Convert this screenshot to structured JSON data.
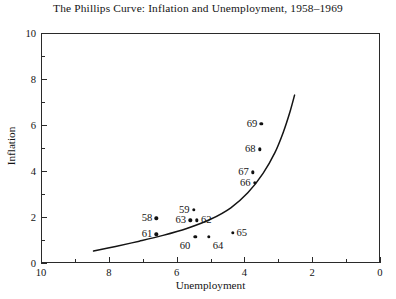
{
  "chart_data": {
    "type": "scatter",
    "title": "The Phillips Curve: Inflation and Unemployment, 1958–1969",
    "xlabel": "Unemployment",
    "ylabel": "Inflation",
    "xlim": [
      10,
      0
    ],
    "ylim": [
      0,
      10
    ],
    "x_reversed": true,
    "grid": false,
    "legend": null,
    "x_ticks_major": [
      "10",
      "8",
      "6",
      "4",
      "2",
      "0"
    ],
    "x_tick_values": [
      10,
      8,
      6,
      4,
      2,
      0
    ],
    "x_minor_values": [
      9,
      7,
      5,
      3,
      1
    ],
    "y_ticks_major": [
      "0",
      "2",
      "4",
      "6",
      "8",
      "10"
    ],
    "y_tick_values": [
      0,
      2,
      4,
      6,
      8,
      10
    ],
    "y_minor_values": [
      1,
      3,
      5,
      7,
      9
    ],
    "points": [
      {
        "label": "58",
        "x": 6.6,
        "y": 1.95,
        "label_side": "left"
      },
      {
        "label": "61",
        "x": 6.6,
        "y": 1.25,
        "label_side": "left"
      },
      {
        "label": "59",
        "x": 5.5,
        "y": 2.3,
        "label_side": "left"
      },
      {
        "label": "63",
        "x": 5.6,
        "y": 1.85,
        "label_side": "left"
      },
      {
        "label": "62",
        "x": 5.4,
        "y": 1.85,
        "label_side": "right"
      },
      {
        "label": "60",
        "x": 5.45,
        "y": 1.15,
        "label_side": "below"
      },
      {
        "label": "64",
        "x": 5.05,
        "y": 1.15,
        "label_side": "belowright"
      },
      {
        "label": "65",
        "x": 4.35,
        "y": 1.3,
        "label_side": "right"
      },
      {
        "label": "66",
        "x": 3.7,
        "y": 3.5,
        "label_side": "left"
      },
      {
        "label": "67",
        "x": 3.75,
        "y": 3.95,
        "label_side": "left"
      },
      {
        "label": "68",
        "x": 3.55,
        "y": 4.95,
        "label_side": "left"
      },
      {
        "label": "69",
        "x": 3.5,
        "y": 6.05,
        "label_side": "left"
      }
    ],
    "curve": {
      "description": "fitted Phillips curve, convex, asymptotic near unemployment 2.4",
      "points": [
        [
          8.45,
          0.52
        ],
        [
          7.8,
          0.72
        ],
        [
          7.1,
          0.95
        ],
        [
          6.4,
          1.2
        ],
        [
          5.7,
          1.5
        ],
        [
          5.0,
          1.9
        ],
        [
          4.4,
          2.4
        ],
        [
          3.9,
          3.05
        ],
        [
          3.45,
          3.9
        ],
        [
          3.1,
          4.8
        ],
        [
          2.85,
          5.7
        ],
        [
          2.65,
          6.6
        ],
        [
          2.52,
          7.3
        ]
      ]
    }
  }
}
